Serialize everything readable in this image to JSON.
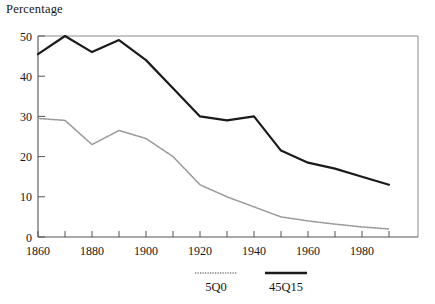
{
  "chart_data": {
    "type": "line",
    "title": "",
    "subtitle": "",
    "ylabel": "Percentage",
    "xlabel": "",
    "xlim": [
      1860,
      1990
    ],
    "ylim": [
      0,
      50
    ],
    "grid": false,
    "legend_position": "bottom",
    "xticks": [
      1860,
      1870,
      1880,
      1890,
      1900,
      1910,
      1920,
      1930,
      1940,
      1950,
      1960,
      1970,
      1980,
      1990
    ],
    "xtick_labels": [
      "1860",
      "",
      "1880",
      "",
      "1900",
      "",
      "1920",
      "",
      "1940",
      "",
      "1960",
      "",
      "1980",
      ""
    ],
    "yticks": [
      0,
      10,
      20,
      30,
      40,
      50
    ],
    "ytick_labels": [
      "0",
      "10",
      "20",
      "30",
      "40",
      "50"
    ],
    "x": [
      1860,
      1870,
      1880,
      1890,
      1900,
      1910,
      1920,
      1930,
      1940,
      1950,
      1960,
      1970,
      1980,
      1990
    ],
    "series": [
      {
        "name": "5Q0",
        "style": "dotted",
        "color": "#9a9a9a",
        "width": 1.6,
        "values": [
          29.5,
          29.0,
          23.0,
          26.5,
          24.5,
          20.0,
          13.0,
          10.0,
          7.5,
          5.0,
          4.0,
          3.2,
          2.5,
          2.0
        ]
      },
      {
        "name": "45Q15",
        "style": "solid",
        "color": "#1a1a1a",
        "width": 2.2,
        "values": [
          45.5,
          50.0,
          46.0,
          49.0,
          44.0,
          37.0,
          30.0,
          29.0,
          30.0,
          21.5,
          18.5,
          17.0,
          15.0,
          13.0
        ]
      }
    ]
  },
  "legend": {
    "items": [
      {
        "label": "5Q0"
      },
      {
        "label": "45Q15"
      }
    ]
  },
  "colors": {
    "axis": "#555555",
    "frame": "#6d6d6d",
    "background": "#ffffff",
    "series_light": "#9a9a9a",
    "series_dark": "#1a1a1a"
  }
}
